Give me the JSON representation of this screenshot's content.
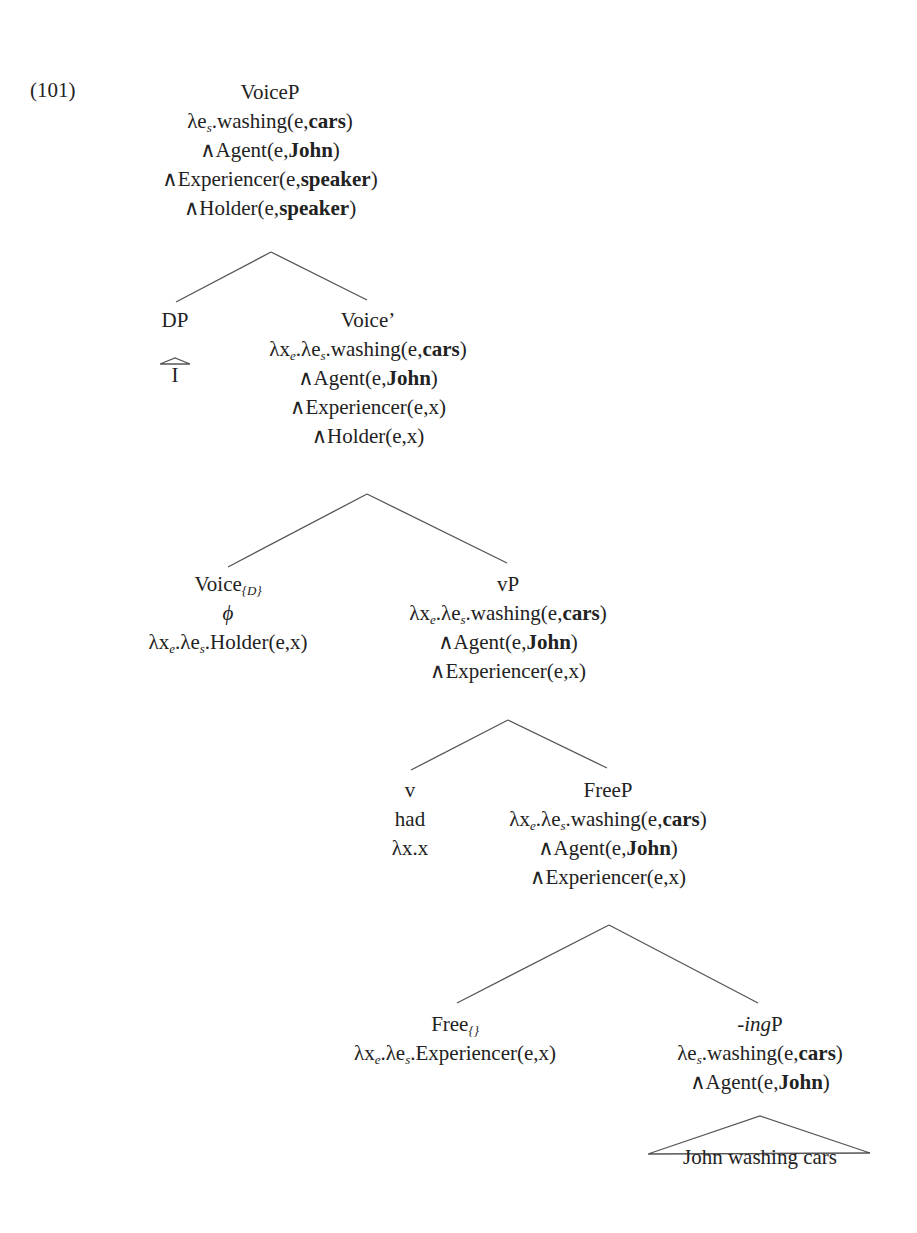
{
  "example_number": "(101)",
  "colors": {
    "text": "#222222",
    "edges": "#555555",
    "background": "#ffffff"
  },
  "nodes": {
    "voiceP": {
      "label": "VoiceP",
      "lines": [
        [
          {
            "t": "λe"
          },
          {
            "sub": "s"
          },
          {
            "t": ".washing(e,"
          },
          {
            "b": "cars"
          },
          {
            "t": ")"
          }
        ],
        [
          {
            "t": "∧Agent(e,"
          },
          {
            "b": "John"
          },
          {
            "t": ")"
          }
        ],
        [
          {
            "t": "∧Experiencer(e,"
          },
          {
            "b": "speaker"
          },
          {
            "t": ")"
          }
        ],
        [
          {
            "t": "∧Holder(e,"
          },
          {
            "b": "speaker"
          },
          {
            "t": ")"
          }
        ]
      ]
    },
    "dp": {
      "label": "DP",
      "terminal": "I"
    },
    "voiceBar": {
      "label": "Voice’",
      "lines": [
        [
          {
            "t": "λx"
          },
          {
            "sub": "e"
          },
          {
            "t": ".λe"
          },
          {
            "sub": "s"
          },
          {
            "t": ".washing(e,"
          },
          {
            "b": "cars"
          },
          {
            "t": ")"
          }
        ],
        [
          {
            "t": "∧Agent(e,"
          },
          {
            "b": "John"
          },
          {
            "t": ")"
          }
        ],
        [
          {
            "t": "∧Experiencer(e,x)"
          }
        ],
        [
          {
            "t": "∧Holder(e,x)"
          }
        ]
      ]
    },
    "voiceD": {
      "label_base": "Voice",
      "label_sub": "{D}",
      "lines": [
        [
          {
            "i": "ϕ"
          }
        ],
        [
          {
            "t": "λx"
          },
          {
            "sub": "e"
          },
          {
            "t": ".λe"
          },
          {
            "sub": "s"
          },
          {
            "t": ".Holder(e,x)"
          }
        ]
      ]
    },
    "vP": {
      "label": "vP",
      "lines": [
        [
          {
            "t": "λx"
          },
          {
            "sub": "e"
          },
          {
            "t": ".λe"
          },
          {
            "sub": "s"
          },
          {
            "t": ".washing(e,"
          },
          {
            "b": "cars"
          },
          {
            "t": ")"
          }
        ],
        [
          {
            "t": "∧Agent(e,"
          },
          {
            "b": "John"
          },
          {
            "t": ")"
          }
        ],
        [
          {
            "t": "∧Experiencer(e,x)"
          }
        ]
      ]
    },
    "v": {
      "label": "v",
      "lines": [
        [
          {
            "t": "had"
          }
        ],
        [
          {
            "t": "λx.x"
          }
        ]
      ]
    },
    "freeP": {
      "label": "FreeP",
      "lines": [
        [
          {
            "t": "λx"
          },
          {
            "sub": "e"
          },
          {
            "t": ".λe"
          },
          {
            "sub": "s"
          },
          {
            "t": ".washing(e,"
          },
          {
            "b": "cars"
          },
          {
            "t": ")"
          }
        ],
        [
          {
            "t": "∧Agent(e,"
          },
          {
            "b": "John"
          },
          {
            "t": ")"
          }
        ],
        [
          {
            "t": "∧Experiencer(e,x)"
          }
        ]
      ]
    },
    "free": {
      "label_base": "Free",
      "label_sub": "{}",
      "lines": [
        [
          {
            "t": "λx"
          },
          {
            "sub": "e"
          },
          {
            "t": ".λe"
          },
          {
            "sub": "s"
          },
          {
            "t": ".Experiencer(e,x)"
          }
        ]
      ]
    },
    "ingP": {
      "label_italic": "-ing",
      "label_rest": "P",
      "lines": [
        [
          {
            "t": "λe"
          },
          {
            "sub": "s"
          },
          {
            "t": ".washing(e,"
          },
          {
            "b": "cars"
          },
          {
            "t": ")"
          }
        ],
        [
          {
            "t": "∧Agent(e,"
          },
          {
            "b": "John"
          },
          {
            "t": ")"
          }
        ]
      ],
      "terminal": "John washing cars"
    }
  }
}
